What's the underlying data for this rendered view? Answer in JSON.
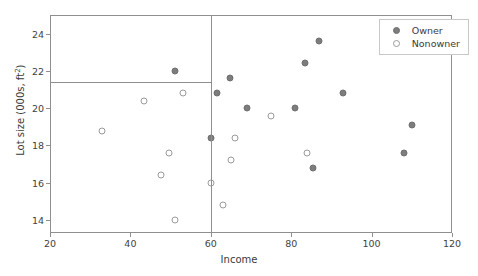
{
  "chart_data": {
    "type": "scatter",
    "title": "",
    "xlabel": "Income",
    "ylabel": "Lot size (000s, ft2)",
    "ylabel_base": "Lot size (000s, ft",
    "ylabel_sup": "2",
    "ylabel_tail": ")",
    "xlim": [
      20,
      120
    ],
    "ylim": [
      13.3,
      25.0
    ],
    "xticks": [
      20,
      40,
      60,
      80,
      100,
      120
    ],
    "yticks": [
      14,
      16,
      18,
      20,
      22,
      24
    ],
    "xticklabels": [
      "20",
      "40",
      "60",
      "80",
      "100",
      "120"
    ],
    "yticklabels": [
      "14",
      "16",
      "18",
      "20",
      "22",
      "24"
    ],
    "grid": false,
    "legend_position": "upper right",
    "series": [
      {
        "name": "Owner",
        "marker": "filled-circle",
        "color": "#7d7d7d",
        "points": [
          {
            "x": 51.0,
            "y": 22.0
          },
          {
            "x": 61.5,
            "y": 20.8
          },
          {
            "x": 64.8,
            "y": 21.6
          },
          {
            "x": 69.0,
            "y": 20.0
          },
          {
            "x": 60.0,
            "y": 18.4
          },
          {
            "x": 81.0,
            "y": 20.0
          },
          {
            "x": 83.5,
            "y": 22.4
          },
          {
            "x": 87.0,
            "y": 23.6
          },
          {
            "x": 85.5,
            "y": 16.8
          },
          {
            "x": 93.0,
            "y": 20.8
          },
          {
            "x": 110.0,
            "y": 19.1
          },
          {
            "x": 108.0,
            "y": 17.6
          }
        ]
      },
      {
        "name": "Nonowner",
        "marker": "open-circle",
        "color": "#ffffff",
        "points": [
          {
            "x": 33.0,
            "y": 18.8
          },
          {
            "x": 43.5,
            "y": 20.4
          },
          {
            "x": 53.0,
            "y": 20.8
          },
          {
            "x": 49.5,
            "y": 17.6
          },
          {
            "x": 47.5,
            "y": 16.4
          },
          {
            "x": 51.0,
            "y": 14.0
          },
          {
            "x": 60.0,
            "y": 16.0
          },
          {
            "x": 63.0,
            "y": 14.8
          },
          {
            "x": 65.0,
            "y": 17.2
          },
          {
            "x": 66.0,
            "y": 18.4
          },
          {
            "x": 75.0,
            "y": 19.6
          },
          {
            "x": 84.0,
            "y": 17.6
          }
        ]
      }
    ],
    "partition_lines": [
      {
        "name": "income-split",
        "orientation": "vertical",
        "value": 60,
        "y_from": 13.3,
        "y_to": 25.0
      },
      {
        "name": "lotsize-split",
        "orientation": "horizontal",
        "value": 21.4,
        "x_from": 20,
        "x_to": 60
      }
    ]
  },
  "legend": {
    "items": [
      {
        "label": "Owner",
        "marker": "filled-circle"
      },
      {
        "label": "Nonowner",
        "marker": "open-circle"
      }
    ]
  }
}
